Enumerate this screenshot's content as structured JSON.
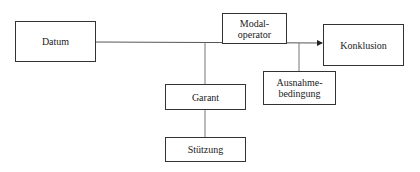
{
  "diagram": {
    "type": "toulmin-argument-model",
    "nodes": {
      "datum": {
        "label": "Datum"
      },
      "modal_operator": {
        "label": "Modal-\noperator"
      },
      "konklusion": {
        "label": "Konklusion"
      },
      "ausnahmebedingung": {
        "label": "Ausnahme-\nbedingung"
      },
      "garant": {
        "label": "Garant"
      },
      "stuetzung": {
        "label": "Stützung"
      }
    },
    "edges": [
      {
        "from": "datum",
        "to": "konklusion",
        "arrow": true
      },
      {
        "from": "main-line",
        "to": "garant",
        "arrow": false
      },
      {
        "from": "main-line",
        "to": "ausnahmebedingung",
        "arrow": false
      },
      {
        "from": "garant",
        "to": "stuetzung",
        "arrow": false
      }
    ],
    "colors": {
      "line": "#555555",
      "border": "#333333",
      "text": "#222222",
      "background": "#ffffff"
    }
  }
}
